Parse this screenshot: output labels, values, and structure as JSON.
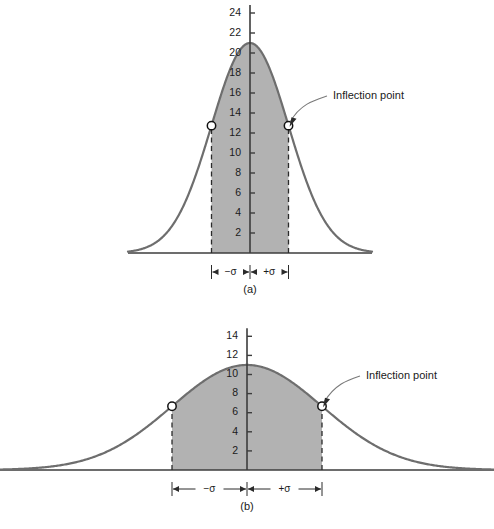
{
  "figure": {
    "background_color": "#ffffff",
    "curve_color": "#6e6e6e",
    "fill_color": "#b2b2b2",
    "axis_color": "#3c3c3c",
    "dash_color": "#2b2b2b",
    "text_color": "#1a1a1a",
    "annotation_text": "Inflection point"
  },
  "chart_data": [
    {
      "type": "area",
      "title": "",
      "panel": "(a)",
      "description": "Normal distribution curve with small standard deviation (tall and narrow), shaded between -sigma and +sigma",
      "xlabel": "",
      "ylabel": "",
      "peak_value": 21,
      "mean_x": 0,
      "sigma": 1,
      "ylim": [
        0,
        24
      ],
      "xlim": [
        -4.2,
        4.2
      ],
      "yticks": [
        2,
        4,
        6,
        8,
        10,
        12,
        14,
        16,
        18,
        20,
        22,
        24
      ],
      "ytick_labels": [
        "2",
        "4",
        "6",
        "8",
        "10",
        "12",
        "14",
        "16",
        "18",
        "20",
        "22",
        "24"
      ],
      "grid": false,
      "inflection_points": [
        {
          "x": -1,
          "y": 12.74
        },
        {
          "x": 1,
          "y": 12.74
        }
      ],
      "annotations": [
        {
          "text": "Inflection point",
          "points_to_x": 1,
          "points_to_y": 12.74
        }
      ],
      "sigma_markers": [
        {
          "label": "−σ",
          "from_x": -1,
          "to_x": 0
        },
        {
          "label": "+σ",
          "from_x": 0,
          "to_x": 1
        }
      ],
      "shaded_region": {
        "from_x": -1,
        "to_x": 1
      },
      "legend": null
    },
    {
      "type": "area",
      "title": "",
      "panel": "(b)",
      "description": "Normal distribution curve with large standard deviation (short and wide), shaded between -sigma and +sigma",
      "xlabel": "",
      "ylabel": "",
      "peak_value": 11,
      "mean_x": 0,
      "sigma": 1,
      "ylim": [
        0,
        14
      ],
      "xlim": [
        -3.3,
        3.3
      ],
      "yticks": [
        2,
        4,
        6,
        8,
        10,
        12,
        14
      ],
      "ytick_labels": [
        "2",
        "4",
        "6",
        "8",
        "10",
        "12",
        "14"
      ],
      "grid": false,
      "inflection_points": [
        {
          "x": -1,
          "y": 6.67
        },
        {
          "x": 1,
          "y": 6.67
        }
      ],
      "annotations": [
        {
          "text": "Inflection point",
          "points_to_x": 1,
          "points_to_y": 6.67
        }
      ],
      "sigma_markers": [
        {
          "label": "−σ",
          "from_x": -1,
          "to_x": 0
        },
        {
          "label": "+σ",
          "from_x": 0,
          "to_x": 1
        }
      ],
      "shaded_region": {
        "from_x": -1,
        "to_x": 1
      },
      "legend": null
    }
  ]
}
